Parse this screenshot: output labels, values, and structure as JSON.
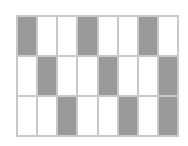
{
  "diagram": {
    "title": "",
    "rows": 3,
    "columns": 8,
    "shaded_color": "#9a9a9a",
    "empty_color": "#ffffff",
    "grid": [
      [
        1,
        0,
        0,
        1,
        0,
        0,
        1,
        0
      ],
      [
        0,
        1,
        0,
        0,
        1,
        0,
        0,
        1
      ],
      [
        0,
        0,
        1,
        0,
        0,
        1,
        0,
        1
      ]
    ]
  }
}
